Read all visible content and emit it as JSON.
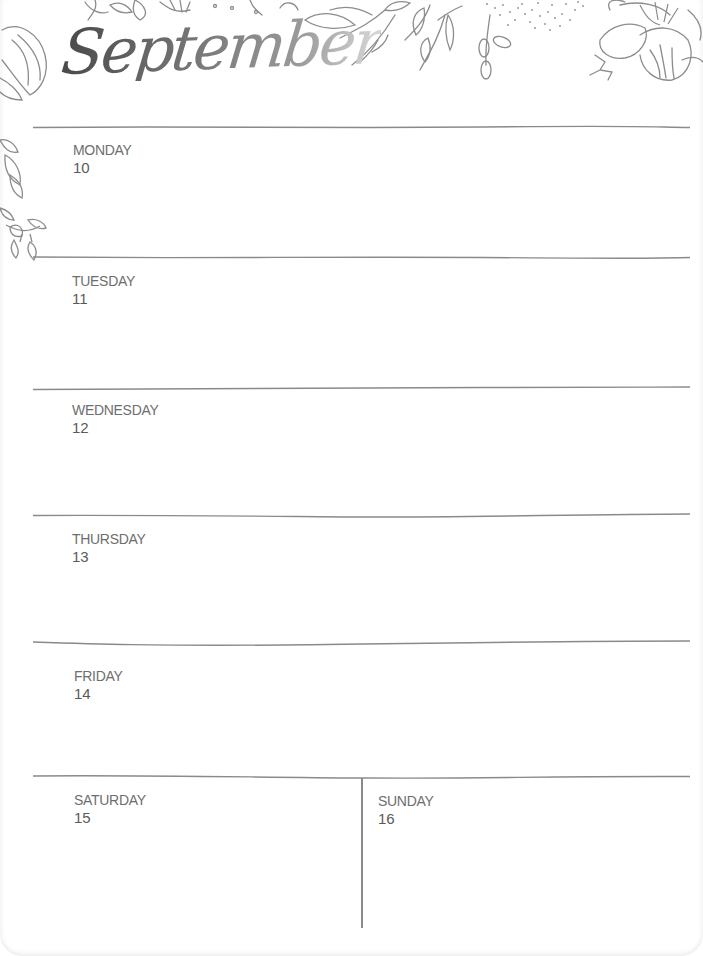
{
  "planner": {
    "month": "September",
    "days": [
      {
        "name": "MONDAY",
        "date": "10"
      },
      {
        "name": "TUESDAY",
        "date": "11"
      },
      {
        "name": "WEDNESDAY",
        "date": "12"
      },
      {
        "name": "THURSDAY",
        "date": "13"
      },
      {
        "name": "FRIDAY",
        "date": "14"
      },
      {
        "name": "SATURDAY",
        "date": "15"
      },
      {
        "name": "SUNDAY",
        "date": "16"
      }
    ]
  },
  "decoration": {
    "top_border": "floral-line-art",
    "left_border": "leaf-and-heart-vine",
    "line_color": "#8a8a8a",
    "text_color": "#6e6e6e"
  }
}
